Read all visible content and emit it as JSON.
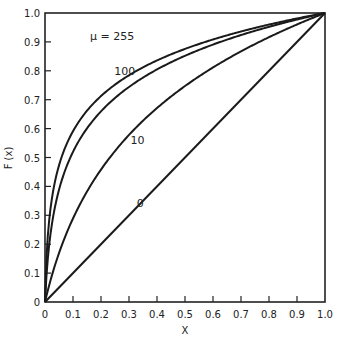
{
  "chart_data": {
    "type": "line",
    "title": "",
    "xlabel": "X",
    "ylabel": "F (x)",
    "xlim": [
      0,
      1.0
    ],
    "ylim": [
      0,
      1.0
    ],
    "grid": false,
    "legend": "inline curve labels",
    "x_ticks": [
      "0",
      "0.1",
      "0.2",
      "0.3",
      "0.4",
      "0.5",
      "0.6",
      "0.7",
      "0.8",
      "0.9",
      "1.0"
    ],
    "y_ticks": [
      "0",
      "0.1",
      "0.2",
      "0.3",
      "0.4",
      "0.5",
      "0.6",
      "0.7",
      "0.8",
      "0.9",
      "1.0"
    ],
    "x": [
      0,
      0.01,
      0.02,
      0.05,
      0.1,
      0.2,
      0.3,
      0.4,
      0.5,
      0.6,
      0.7,
      0.8,
      0.9,
      1.0
    ],
    "series": [
      {
        "name": "μ=255",
        "label": "μ = 255",
        "values": [
          0,
          0.228,
          0.332,
          0.484,
          0.591,
          0.713,
          0.785,
          0.836,
          0.876,
          0.908,
          0.936,
          0.96,
          0.981,
          1.0
        ]
      },
      {
        "name": "μ=100",
        "label": "100",
        "values": [
          0,
          0.15,
          0.238,
          0.388,
          0.52,
          0.66,
          0.744,
          0.805,
          0.852,
          0.891,
          0.924,
          0.952,
          0.977,
          1.0
        ]
      },
      {
        "name": "μ=10",
        "label": "10",
        "values": [
          0,
          0.04,
          0.076,
          0.169,
          0.289,
          0.458,
          0.578,
          0.671,
          0.747,
          0.811,
          0.867,
          0.916,
          0.96,
          1.0
        ]
      },
      {
        "name": "μ=0",
        "label": "0",
        "values": [
          0,
          0.01,
          0.02,
          0.05,
          0.1,
          0.2,
          0.3,
          0.4,
          0.5,
          0.6,
          0.7,
          0.8,
          0.9,
          1.0
        ]
      }
    ],
    "annotations": [
      {
        "text": "μ = 255",
        "x": 0.24,
        "y": 0.905
      },
      {
        "text": "100",
        "x": 0.285,
        "y": 0.785
      },
      {
        "text": "10",
        "x": 0.33,
        "y": 0.545
      },
      {
        "text": "0",
        "x": 0.34,
        "y": 0.33
      }
    ]
  }
}
